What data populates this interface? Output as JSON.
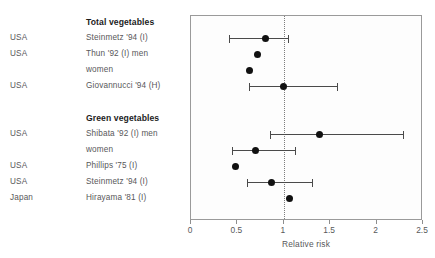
{
  "chart_data": {
    "type": "scatter",
    "title": "",
    "xlabel": "Relative risk",
    "ylabel": "",
    "xlim": [
      0,
      2.5
    ],
    "xticks": [
      0,
      0.5,
      1,
      1.5,
      2,
      2.5
    ],
    "xtick_labels": [
      "0",
      "0.5",
      "1",
      "1.5",
      "2",
      "2.5"
    ],
    "grid": false,
    "legend": "none",
    "reference_line": 1,
    "columns": [
      "Country",
      "Study",
      "Relative risk",
      "95% CI low",
      "95% CI high"
    ],
    "groups": [
      {
        "heading": "Total vegetables",
        "rows": [
          {
            "country": "USA",
            "study": "Steinmetz '94 (I)",
            "rr": 0.8,
            "ci_low": 0.41,
            "ci_high": 1.05,
            "has_ci": true
          },
          {
            "country": "USA",
            "study": "Thun '92 (I) men",
            "rr": 0.72,
            "ci_low": null,
            "ci_high": null,
            "has_ci": false
          },
          {
            "country": "",
            "study": "women",
            "rr": 0.63,
            "ci_low": null,
            "ci_high": null,
            "has_ci": false
          },
          {
            "country": "USA",
            "study": "Giovannucci '94 (H)",
            "rr": 1.0,
            "ci_low": 0.62,
            "ci_high": 1.57,
            "has_ci": true
          }
        ]
      },
      {
        "heading": "Green vegetables",
        "rows": [
          {
            "country": "USA",
            "study": "Shibata '92 (I) men",
            "rr": 1.38,
            "ci_low": 0.85,
            "ci_high": 2.28,
            "has_ci": true
          },
          {
            "country": "",
            "study": "women",
            "rr": 0.7,
            "ci_low": 0.44,
            "ci_high": 1.12,
            "has_ci": true
          },
          {
            "country": "USA",
            "study": "Phillips '75 (I)",
            "rr": 0.48,
            "ci_low": null,
            "ci_high": null,
            "has_ci": false
          },
          {
            "country": "USA",
            "study": "Steinmetz '94 (I)",
            "rr": 0.87,
            "ci_low": 0.6,
            "ci_high": 1.3,
            "has_ci": true
          },
          {
            "country": "Japan",
            "study": "Hirayama '81 (I)",
            "rr": 1.06,
            "ci_low": null,
            "ci_high": null,
            "has_ci": false
          }
        ]
      }
    ]
  },
  "colors": {
    "marker": "#111111",
    "ci_line": "#4a4a4a",
    "text": "#58585a",
    "heading_text": "#1c1c1c",
    "frame": "#9a9a9a",
    "reference_line": "#7d7d7d",
    "background": "#ffffff"
  }
}
